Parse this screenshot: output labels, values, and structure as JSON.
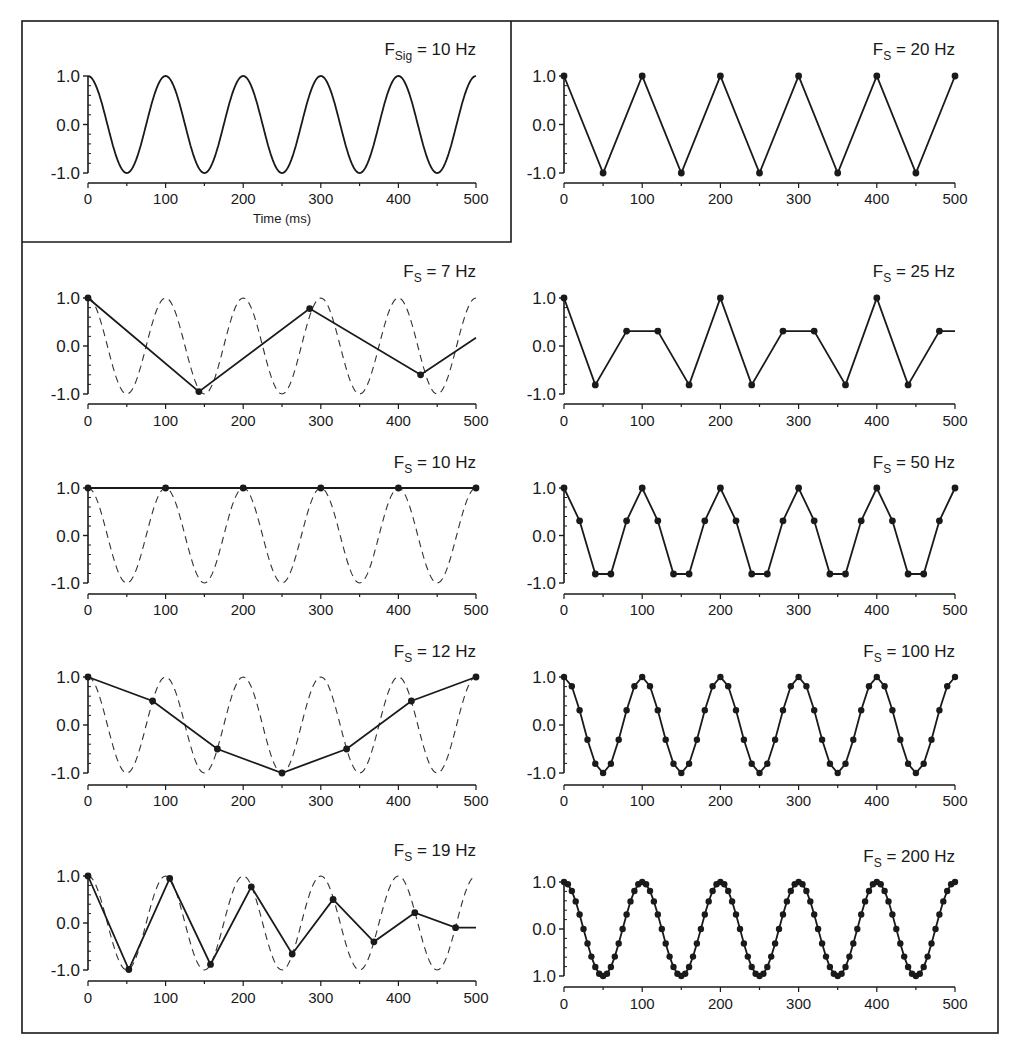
{
  "figure": {
    "frame_color": "#1a1a1a",
    "line_color": "#1a1a1a",
    "dashed_color": "#333333"
  },
  "chart_data": [
    {
      "type": "line",
      "id": "original",
      "title_main": "F",
      "title_sub": "Sig",
      "title_rest": " = 10 Hz",
      "signal_freq_hz": 10,
      "xlabel": "Time (ms)",
      "ylabel": "",
      "xlim": [
        0,
        500
      ],
      "ylim": [
        -1,
        1
      ],
      "xticks": [
        "0",
        "100",
        "200",
        "300",
        "400",
        "500"
      ],
      "yticks": [
        "1.0",
        "0.0",
        "-1.0"
      ],
      "series": [
        {
          "name": "signal",
          "style": "solid",
          "function": "cos(2*pi*10*t)"
        }
      ]
    },
    {
      "type": "line",
      "id": "fs20",
      "title_main": "F",
      "title_sub": "S",
      "title_rest": " = 20 Hz",
      "sample_rate_hz": 20,
      "xlim": [
        0,
        500
      ],
      "ylim": [
        -1,
        1
      ],
      "xticks": [
        "0",
        "100",
        "200",
        "300",
        "400",
        "500"
      ],
      "yticks": [
        "1.0",
        "0.0",
        "-1.0"
      ],
      "show_reference": false,
      "series": [
        {
          "name": "sampled",
          "x": [
            0,
            50,
            100,
            150,
            200,
            250,
            300,
            350,
            400,
            450,
            500
          ],
          "y": [
            1,
            -1,
            1,
            -1,
            1,
            -1,
            1,
            -1,
            1,
            -1,
            1
          ]
        }
      ]
    },
    {
      "type": "line",
      "id": "fs7",
      "title_main": "F",
      "title_sub": "S",
      "title_rest": " = 7 Hz",
      "sample_rate_hz": 7,
      "xlim": [
        0,
        500
      ],
      "ylim": [
        -1,
        1
      ],
      "xticks": [
        "0",
        "100",
        "200",
        "300",
        "400",
        "500"
      ],
      "yticks": [
        "1.0",
        "0.0",
        "-1.0"
      ],
      "show_reference": true,
      "series": [
        {
          "name": "sampled",
          "x": [
            0,
            142.9,
            285.7,
            428.6,
            500
          ],
          "y": [
            1,
            -0.95,
            0.78,
            -0.6,
            0.17
          ],
          "markers_count": 4
        }
      ]
    },
    {
      "type": "line",
      "id": "fs25",
      "title_main": "F",
      "title_sub": "S",
      "title_rest": " = 25 Hz",
      "sample_rate_hz": 25,
      "xlim": [
        0,
        500
      ],
      "ylim": [
        -1,
        1
      ],
      "xticks": [
        "0",
        "100",
        "200",
        "300",
        "400",
        "500"
      ],
      "yticks": [
        "1.0",
        "0.0",
        "-1.0"
      ],
      "show_reference": false,
      "series": [
        {
          "name": "sampled",
          "x": [
            0,
            40,
            80,
            120,
            160,
            200,
            240,
            280,
            320,
            360,
            400,
            440,
            480,
            500
          ],
          "y": [
            1,
            -0.81,
            0.31,
            0.31,
            -0.81,
            1,
            -0.81,
            0.31,
            0.31,
            -0.81,
            1,
            -0.81,
            0.31,
            0.31
          ],
          "markers_count": 13
        }
      ]
    },
    {
      "type": "line",
      "id": "fs10",
      "title_main": "F",
      "title_sub": "S",
      "title_rest": " = 10 Hz",
      "sample_rate_hz": 10,
      "xlim": [
        0,
        500
      ],
      "ylim": [
        -1,
        1
      ],
      "xticks": [
        "0",
        "100",
        "200",
        "300",
        "400",
        "500"
      ],
      "yticks": [
        "1.0",
        "0.0",
        "-1.0"
      ],
      "show_reference": true,
      "series": [
        {
          "name": "sampled",
          "x": [
            0,
            100,
            200,
            300,
            400,
            500
          ],
          "y": [
            1,
            1,
            1,
            1,
            1,
            1
          ]
        }
      ]
    },
    {
      "type": "line",
      "id": "fs50",
      "title_main": "F",
      "title_sub": "S",
      "title_rest": " = 50 Hz",
      "sample_rate_hz": 50,
      "xlim": [
        0,
        500
      ],
      "ylim": [
        -1,
        1
      ],
      "xticks": [
        "0",
        "100",
        "200",
        "300",
        "400",
        "500"
      ],
      "yticks": [
        "1.0",
        "0.0",
        "-1.0"
      ],
      "show_reference": false,
      "series": [
        {
          "name": "sampled",
          "x": [
            0,
            20,
            40,
            60,
            80,
            100,
            120,
            140,
            160,
            180,
            200,
            220,
            240,
            260,
            280,
            300,
            320,
            340,
            360,
            380,
            400,
            420,
            440,
            460,
            480,
            500
          ],
          "y": [
            1,
            0.31,
            -0.81,
            -0.81,
            0.31,
            1,
            0.31,
            -0.81,
            -0.81,
            0.31,
            1,
            0.31,
            -0.81,
            -0.81,
            0.31,
            1,
            0.31,
            -0.81,
            -0.81,
            0.31,
            1,
            0.31,
            -0.81,
            -0.81,
            0.31,
            1
          ]
        }
      ]
    },
    {
      "type": "line",
      "id": "fs12",
      "title_main": "F",
      "title_sub": "S",
      "title_rest": " = 12 Hz",
      "sample_rate_hz": 12,
      "xlim": [
        0,
        500
      ],
      "ylim": [
        -1,
        1
      ],
      "xticks": [
        "0",
        "100",
        "200",
        "300",
        "400",
        "500"
      ],
      "yticks": [
        "1.0",
        "0.0",
        "-1.0"
      ],
      "show_reference": true,
      "series": [
        {
          "name": "sampled",
          "x": [
            0,
            83.3,
            166.7,
            250,
            333.3,
            416.7,
            500
          ],
          "y": [
            1,
            0.5,
            -0.5,
            -1,
            -0.5,
            0.5,
            1
          ]
        }
      ]
    },
    {
      "type": "line",
      "id": "fs100",
      "title_main": "F",
      "title_sub": "S",
      "title_rest": " = 100 Hz",
      "sample_rate_hz": 100,
      "xlim": [
        0,
        500
      ],
      "ylim": [
        -1,
        1
      ],
      "xticks": [
        "0",
        "100",
        "200",
        "300",
        "400",
        "500"
      ],
      "yticks": [
        "1.0",
        "0.0",
        "-1.0"
      ],
      "show_reference": false,
      "series": [
        {
          "name": "sampled",
          "step_ms": 10,
          "function": "cos(2*pi*10*t)",
          "points": 51
        }
      ]
    },
    {
      "type": "line",
      "id": "fs19",
      "title_main": "F",
      "title_sub": "S",
      "title_rest": " = 19 Hz",
      "sample_rate_hz": 19,
      "xlim": [
        0,
        500
      ],
      "ylim": [
        -1,
        1
      ],
      "xticks": [
        "0",
        "100",
        "200",
        "300",
        "400",
        "500"
      ],
      "yticks": [
        "1.0",
        "0.0",
        "-1.0"
      ],
      "show_reference": true,
      "series": [
        {
          "name": "sampled",
          "x": [
            0,
            52.6,
            105.3,
            157.9,
            210.5,
            263.2,
            315.8,
            368.4,
            421.1,
            473.7,
            500
          ],
          "y": [
            1,
            -0.99,
            0.95,
            -0.88,
            0.77,
            -0.66,
            0.5,
            -0.4,
            0.22,
            -0.1,
            -0.1
          ],
          "markers_count": 10
        }
      ]
    },
    {
      "type": "line",
      "id": "fs200",
      "title_main": "F",
      "title_sub": "S",
      "title_rest": " = 200 Hz",
      "sample_rate_hz": 200,
      "xlim": [
        0,
        500
      ],
      "ylim": [
        -1,
        1
      ],
      "xticks": [
        "0",
        "100",
        "200",
        "300",
        "400",
        "500"
      ],
      "yticks": [
        "1.0",
        "0.0",
        "1.0"
      ],
      "show_reference": false,
      "series": [
        {
          "name": "sampled",
          "step_ms": 5,
          "function": "cos(2*pi*10*t)",
          "points": 101
        }
      ]
    }
  ]
}
